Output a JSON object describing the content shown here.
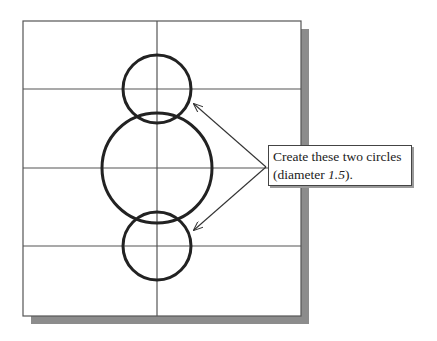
{
  "diagram": {
    "frame": {
      "x": 23,
      "y": 21,
      "width": 278,
      "height": 295,
      "stroke": "#555555",
      "shadow_color": "#8c8c8c"
    },
    "grid": {
      "vertical_lines_x": [
        157
      ],
      "horizontal_lines_y": [
        89,
        168,
        246
      ],
      "stroke": "#555555"
    },
    "circles": [
      {
        "name": "top-small-circle",
        "cx": 157,
        "cy": 89,
        "r": 34
      },
      {
        "name": "large-center-circle",
        "cx": 157,
        "cy": 168,
        "r": 55
      },
      {
        "name": "bottom-small-circle",
        "cx": 157,
        "cy": 246,
        "r": 34
      }
    ],
    "circle_stroke": "#222222",
    "leaders": [
      {
        "from": [
          266,
          167
        ],
        "to": [
          194,
          104
        ]
      },
      {
        "from": [
          266,
          167
        ],
        "to": [
          194,
          230
        ]
      }
    ]
  },
  "callout": {
    "line1": "Create these two circles",
    "line2_prefix": "(diameter ",
    "line2_value": "1.5",
    "line2_suffix": ")."
  }
}
